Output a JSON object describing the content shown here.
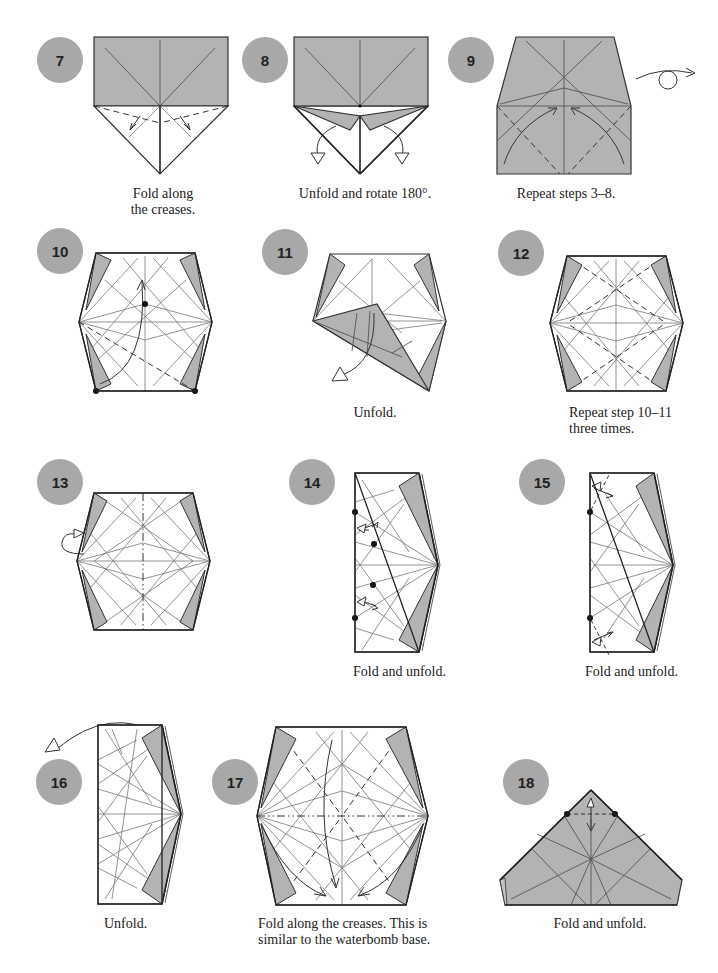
{
  "page": {
    "background": "#ffffff",
    "badge_color": "#a8a8a8",
    "paper_color": "#b3b3b3"
  },
  "steps": [
    {
      "number": "7",
      "caption_lines": [
        "Fold along",
        "the creases."
      ],
      "diagram": "triangle-flap-fold"
    },
    {
      "number": "8",
      "caption_lines": [
        "Unfold and rotate 180°."
      ],
      "diagram": "unfold-flaps"
    },
    {
      "number": "9",
      "caption_lines": [
        "Repeat steps 3–8."
      ],
      "diagram": "trapezoid-turn-over",
      "icon": "turn-over-icon"
    },
    {
      "number": "10",
      "caption_lines": [],
      "diagram": "hexagon-fold-corner-to-center"
    },
    {
      "number": "11",
      "caption_lines": [
        "Unfold."
      ],
      "diagram": "hexagon-folded-flap"
    },
    {
      "number": "12",
      "caption_lines": [
        "Repeat step 10–11",
        "three times."
      ],
      "diagram": "hexagon-valley-creases"
    },
    {
      "number": "13",
      "caption_lines": [],
      "diagram": "hexagon-mountain-fold-in-half"
    },
    {
      "number": "14",
      "caption_lines": [
        "Fold and unfold."
      ],
      "diagram": "half-hexagon-small-folds"
    },
    {
      "number": "15",
      "caption_lines": [
        "Fold and unfold."
      ],
      "diagram": "half-hexagon-corner-folds"
    },
    {
      "number": "16",
      "caption_lines": [
        "Unfold."
      ],
      "diagram": "half-hexagon-unfold"
    },
    {
      "number": "17",
      "caption_lines": [
        "Fold along the creases. This is",
        "similar to the waterbomb base."
      ],
      "diagram": "hexagon-collapse"
    },
    {
      "number": "18",
      "caption_lines": [
        "Fold and unfold."
      ],
      "diagram": "waterbomb-base-tip-fold"
    }
  ]
}
